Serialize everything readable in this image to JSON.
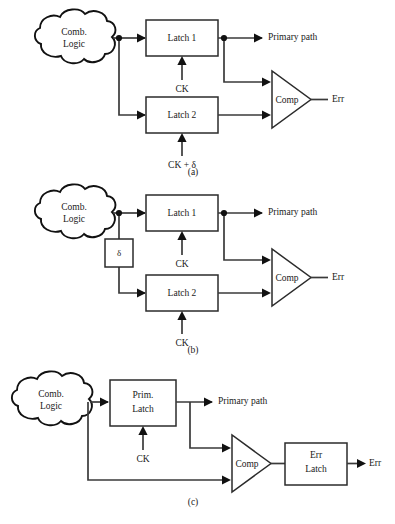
{
  "figure": {
    "caption_a": "(a)",
    "caption_b": "(b)",
    "caption_c": "(c)"
  },
  "diagram_a": {
    "comb_logic_line1": "Comb.",
    "comb_logic_line2": "Logic",
    "latch1": "Latch 1",
    "latch2": "Latch 2",
    "comparator": "Comp",
    "primary_path": "Primary path",
    "err": "Err",
    "clock_latch1": "CK",
    "clock_latch2": "CK + δ"
  },
  "diagram_b": {
    "comb_logic_line1": "Comb.",
    "comb_logic_line2": "Logic",
    "delay": "δ",
    "latch1": "Latch 1",
    "latch2": "Latch 2",
    "comparator": "Comp",
    "primary_path": "Primary path",
    "err": "Err",
    "clock_latch1": "CK",
    "clock_latch2": "CK"
  },
  "diagram_c": {
    "comb_logic_line1": "Comb.",
    "comb_logic_line2": "Logic",
    "prim_latch_line1": "Prim.",
    "prim_latch_line2": "Latch",
    "err_latch_line1": "Err",
    "err_latch_line2": "Latch",
    "comparator": "Comp",
    "primary_path": "Primary path",
    "err": "Err",
    "clock_prim_latch": "CK"
  }
}
